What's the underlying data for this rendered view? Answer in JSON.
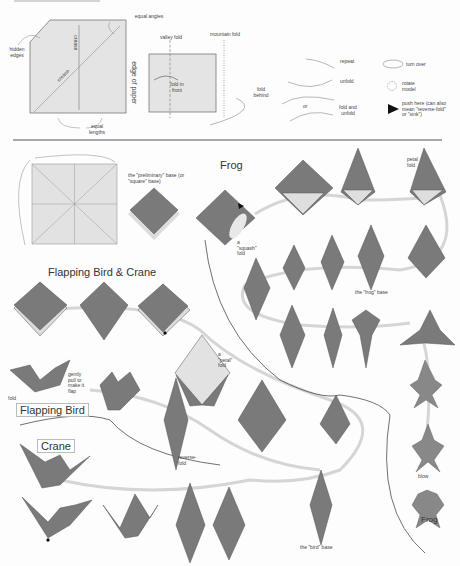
{
  "legend": {
    "crease_pattern": {
      "hidden_edges": "hidden edges",
      "equal_angles": "equal angles",
      "crease_vertical": "crease",
      "crease_diagonal": "crease",
      "edge_of_paper": "edge of paper",
      "equal_lengths": "equal lengths"
    },
    "folds": {
      "valley_fold": "valley fold",
      "mountain_fold": "mountain fold",
      "fold_in_front": "fold in front",
      "fold_behind": "fold behind"
    },
    "arrows": {
      "repeat": "repeat",
      "unfold": "unfold",
      "or": "or",
      "fold_and_unfold": "fold and unfold",
      "turn_over": "turn over",
      "rotate_model": "rotate model",
      "push_here": "push here (can also mean \"reverse-fold\" or \"sink\")"
    }
  },
  "steps": {
    "preliminary_base": "the \"preliminary\" base (or \"square\" base)",
    "squash_fold": "a \"squash\" fold",
    "petal_fold_top": "petal fold",
    "frog_base": "the \"frog\" base",
    "petal_fold_mid": "a \"petal\" fold",
    "gently_pull": "gently pull to make it flap",
    "fold_label": "fold",
    "reverse_fold": "reverse-fold",
    "bird_base": "the \"bird\" base",
    "blow": "blow"
  },
  "sections": {
    "frog": "Frog",
    "flapping_bird_crane": "Flapping Bird & Crane",
    "flapping_bird": "Flapping Bird",
    "crane": "Crane",
    "frog_final": "Frog"
  },
  "colors": {
    "paper_dark": "#7a7a7a",
    "paper_light": "#d9d9d9",
    "path_line": "#cfcfcf",
    "divider": "#555555"
  }
}
